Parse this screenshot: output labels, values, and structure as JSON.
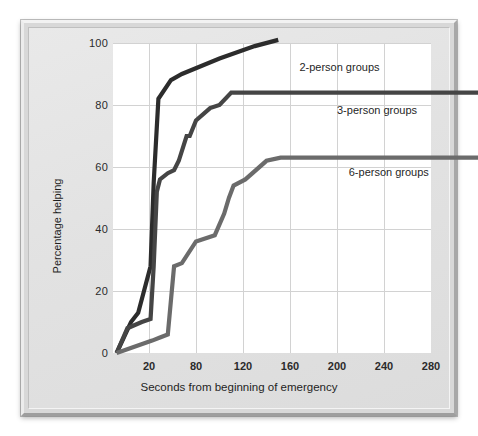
{
  "chart_data": {
    "type": "line",
    "title": "",
    "xlabel": "Seconds from beginning of emergency",
    "ylabel": "Percentage helping",
    "xlim": [
      0,
      290
    ],
    "ylim": [
      0,
      100
    ],
    "grid": true,
    "legend_position": "inline-annotation",
    "xticks": [
      {
        "value": 20,
        "label": "20"
      },
      {
        "value": 80,
        "label": "80"
      },
      {
        "value": 120,
        "label": "120"
      },
      {
        "value": 160,
        "label": "160"
      },
      {
        "value": 200,
        "label": "200"
      },
      {
        "value": 240,
        "label": "240"
      },
      {
        "value": 280,
        "label": "280"
      }
    ],
    "yticks": [
      {
        "value": 0,
        "label": "0"
      },
      {
        "value": 20,
        "label": "20"
      },
      {
        "value": 40,
        "label": "40"
      },
      {
        "value": 60,
        "label": "60"
      },
      {
        "value": 80,
        "label": "80"
      },
      {
        "value": 100,
        "label": "100"
      }
    ],
    "series": [
      {
        "name": "2-person groups",
        "color": "#2c2c2c",
        "label_x": 168,
        "label_y": 92,
        "points": [
          [
            2,
            0
          ],
          [
            10,
            10
          ],
          [
            14,
            13
          ],
          [
            22,
            28
          ],
          [
            26,
            55
          ],
          [
            32,
            82
          ],
          [
            48,
            88
          ],
          [
            62,
            90
          ],
          [
            100,
            95
          ],
          [
            130,
            99
          ],
          [
            150,
            101
          ]
        ]
      },
      {
        "name": "3-person groups",
        "color": "#454545",
        "label_x": 200,
        "label_y": 78,
        "points": [
          [
            2,
            0
          ],
          [
            8,
            8
          ],
          [
            16,
            10
          ],
          [
            22,
            11
          ],
          [
            26,
            28
          ],
          [
            30,
            52
          ],
          [
            34,
            56
          ],
          [
            44,
            58
          ],
          [
            52,
            59
          ],
          [
            58,
            62
          ],
          [
            68,
            70
          ],
          [
            72,
            70
          ],
          [
            80,
            75
          ],
          [
            92,
            79
          ],
          [
            100,
            80
          ],
          [
            110,
            84
          ],
          [
            290,
            84
          ]
        ]
      },
      {
        "name": "6-person groups",
        "color": "#6b6b6b",
        "label_x": 210,
        "label_y": 58,
        "points": [
          [
            2,
            0
          ],
          [
            24,
            4
          ],
          [
            34,
            5
          ],
          [
            44,
            6
          ],
          [
            52,
            28
          ],
          [
            62,
            29
          ],
          [
            80,
            36
          ],
          [
            96,
            38
          ],
          [
            104,
            45
          ],
          [
            108,
            50
          ],
          [
            112,
            54
          ],
          [
            122,
            56
          ],
          [
            140,
            62
          ],
          [
            152,
            63
          ],
          [
            290,
            63
          ]
        ]
      }
    ]
  },
  "labels": {
    "series_2": "2-person groups",
    "series_3": "3-person groups",
    "series_6": "6-person groups",
    "x_axis_title": "Seconds from beginning of emergency",
    "y_axis_title": "Percentage helping"
  }
}
